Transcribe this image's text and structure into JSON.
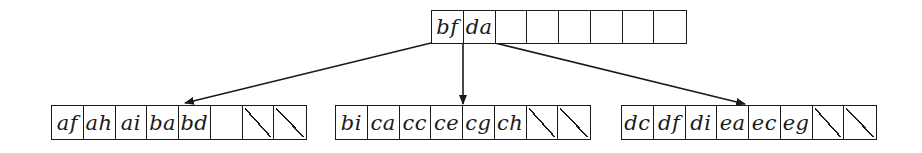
{
  "diagram": {
    "type": "b-tree",
    "root": {
      "keys": [
        "bf",
        "da",
        "",
        "",
        "",
        "",
        "",
        ""
      ],
      "slashed": [
        false,
        false,
        false,
        false,
        false,
        false,
        false,
        false
      ]
    },
    "children": [
      {
        "id": "left",
        "keys": [
          "af",
          "ah",
          "ai",
          "ba",
          "bd",
          "",
          "",
          ""
        ],
        "slashed": [
          false,
          false,
          false,
          false,
          false,
          false,
          true,
          true
        ]
      },
      {
        "id": "middle",
        "keys": [
          "bi",
          "ca",
          "cc",
          "ce",
          "cg",
          "ch",
          "",
          ""
        ],
        "slashed": [
          false,
          false,
          false,
          false,
          false,
          false,
          true,
          true
        ]
      },
      {
        "id": "right",
        "keys": [
          "dc",
          "df",
          "di",
          "ea",
          "ec",
          "eg",
          "",
          ""
        ],
        "slashed": [
          false,
          false,
          false,
          false,
          false,
          false,
          true,
          true
        ]
      }
    ],
    "edges": [
      {
        "from": "root",
        "to": "left"
      },
      {
        "from": "root",
        "to": "middle"
      },
      {
        "from": "root",
        "to": "right"
      }
    ],
    "colors": {
      "line": "#1a1a1a",
      "background": "#ffffff"
    }
  }
}
